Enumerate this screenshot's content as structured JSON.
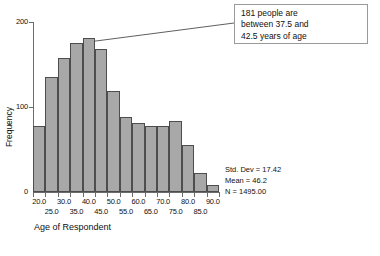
{
  "chart_data": {
    "type": "bar",
    "title": "",
    "xlabel": "Age of Respondent",
    "ylabel": "Frequency",
    "ylim": [
      0,
      200
    ],
    "yticks": [
      0,
      100,
      200
    ],
    "ytick_labels": [
      "0",
      "100",
      "200"
    ],
    "grid": false,
    "legend": "none",
    "bin_width": 5,
    "bin_centers": [
      20.0,
      25.0,
      30.0,
      35.0,
      40.0,
      45.0,
      50.0,
      55.0,
      60.0,
      65.0,
      70.0,
      75.0,
      80.0,
      85.0,
      90.0
    ],
    "categories": [
      "20.0",
      "25.0",
      "30.0",
      "35.0",
      "40.0",
      "45.0",
      "50.0",
      "55.0",
      "60.0",
      "65.0",
      "70.0",
      "75.0",
      "80.0",
      "85.0",
      "90.0"
    ],
    "values": [
      78,
      135,
      158,
      175,
      181,
      168,
      119,
      88,
      81,
      78,
      78,
      83,
      55,
      22,
      8
    ],
    "xtick_labels_row1": [
      "20.0",
      "30.0",
      "40.0",
      "50.0",
      "60.0",
      "70.0",
      "80.0",
      "90.0"
    ],
    "xtick_labels_row2": [
      "25.0",
      "35.0",
      "45.0",
      "55.0",
      "65.0",
      "75.0",
      "85.0"
    ],
    "bar_fill_color": "#a8a8a8",
    "bar_edge_color": "#4d4d4d"
  },
  "callout": {
    "line1": "181 people are",
    "line2": "between 37.5 and",
    "line3": "42.5 years of age",
    "target_bin_center": 40.0,
    "target_value": 181
  },
  "stats": {
    "std_dev": "Std. Dev = 17.42",
    "mean": "Mean = 46.2",
    "n": "N = 1495.00"
  },
  "axis": {
    "ylabel": "Frequency",
    "xlabel": "Age of Respondent",
    "ytick_200": "200",
    "ytick_100": "100",
    "ytick_0": "0"
  }
}
